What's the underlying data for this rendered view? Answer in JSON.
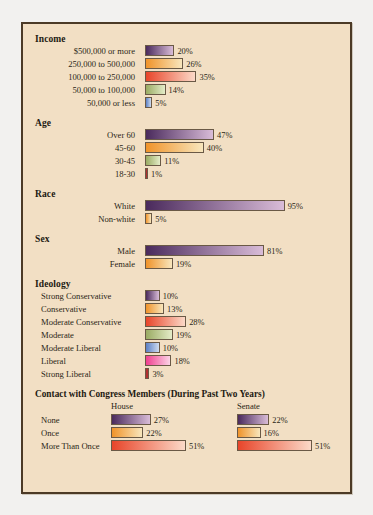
{
  "chart_data": {
    "type": "bar",
    "xlabel": "",
    "ylabel": "",
    "xlim": [
      0,
      100
    ],
    "grid": false,
    "legend": "none",
    "orientation": "horizontal",
    "value_suffix": "%",
    "colors": {
      "purple": "#4a2a5c",
      "purple_light": "#d9bcd8",
      "orange": "#f0932a",
      "orange_light": "#f8e6bd",
      "red": "#e8452a",
      "red_light": "#fbd9c8",
      "olive": "#9aab63",
      "olive_light": "#e4ecc8",
      "blue": "#5b7fc4",
      "blue_light": "#cfdcef",
      "pink": "#ef3f8f",
      "pink_light": "#fbd3e6",
      "maroon": "#b03030",
      "panel_bg": "#f2dfc4",
      "border": "#4c3a26",
      "page_bg": "#f2f1ef"
    },
    "groups": [
      {
        "name": "Income",
        "label_align": "right",
        "categories": [
          "$500,000 or more",
          "250,000 to 500,000",
          "100,000 to 250,000",
          "50,000 to 100,000",
          "50,000 or less"
        ],
        "values": [
          20,
          26,
          35,
          14,
          5
        ],
        "value_labels": [
          "20%",
          "26%",
          "35%",
          "14%",
          "5%"
        ],
        "bar_colors": [
          "purple",
          "orange",
          "red",
          "olive",
          "blue"
        ]
      },
      {
        "name": "Age",
        "label_align": "right",
        "categories": [
          "Over 60",
          "45-60",
          "30-45",
          "18-30"
        ],
        "values": [
          47,
          40,
          11,
          1
        ],
        "value_labels": [
          "47%",
          "40%",
          "11%",
          "1%"
        ],
        "bar_colors": [
          "purple",
          "orange",
          "olive",
          "maroon"
        ]
      },
      {
        "name": "Race",
        "label_align": "right",
        "categories": [
          "White",
          "Non-white"
        ],
        "values": [
          95,
          5
        ],
        "value_labels": [
          "95%",
          "5%"
        ],
        "bar_colors": [
          "purple",
          "orange"
        ]
      },
      {
        "name": "Sex",
        "label_align": "right",
        "categories": [
          "Male",
          "Female"
        ],
        "values": [
          81,
          19
        ],
        "value_labels": [
          "81%",
          "19%"
        ],
        "bar_colors": [
          "purple",
          "orange"
        ]
      },
      {
        "name": "Ideology",
        "label_align": "left",
        "categories": [
          "Strong Conservative",
          "Conservative",
          "Moderate Conservative",
          "Moderate",
          "Moderate Liberal",
          "Liberal",
          "Strong Liberal"
        ],
        "values": [
          10,
          13,
          28,
          19,
          10,
          18,
          3
        ],
        "value_labels": [
          "10%",
          "13%",
          "28%",
          "19%",
          "10%",
          "18%",
          "3%"
        ],
        "bar_colors": [
          "purple",
          "orange",
          "red",
          "olive",
          "blue",
          "pink",
          "maroon"
        ]
      }
    ],
    "paired_group": {
      "name": "Contact with Congress Members (During Past Two Years)",
      "categories": [
        "None",
        "Once",
        "More Than Once"
      ],
      "series": [
        {
          "name": "House",
          "values": [
            27,
            22,
            51
          ],
          "value_labels": [
            "27%",
            "22%",
            "51%"
          ],
          "bar_colors": [
            "purple",
            "orange",
            "red"
          ]
        },
        {
          "name": "Senate",
          "values": [
            22,
            16,
            51
          ],
          "value_labels": [
            "22%",
            "16%",
            "51%"
          ],
          "bar_colors": [
            "purple",
            "orange",
            "red"
          ]
        }
      ]
    }
  }
}
